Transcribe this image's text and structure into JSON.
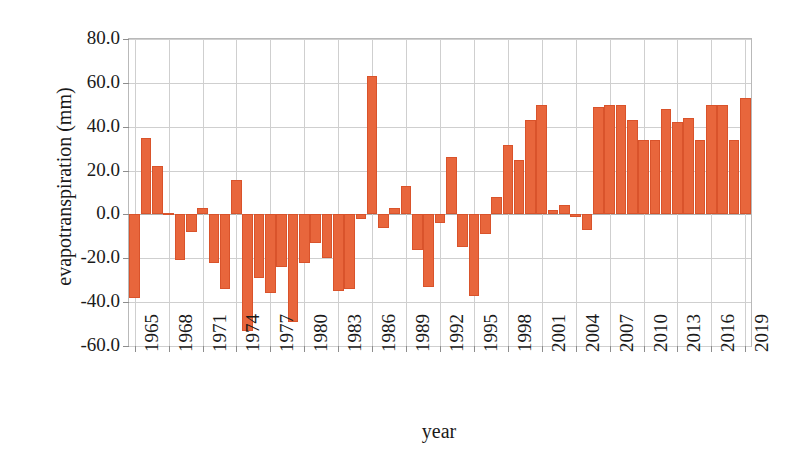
{
  "chart_data": {
    "type": "bar",
    "title": "",
    "xlabel": "year",
    "ylabel": "evapotranspiration (mm)",
    "ylim": [
      -60.0,
      80.0
    ],
    "ytick_labels": [
      "80.0",
      "60.0",
      "40.0",
      "20.0",
      "0.0",
      "-20.0",
      "-40.0",
      "-60.0"
    ],
    "ytick_values": [
      80.0,
      60.0,
      40.0,
      20.0,
      0.0,
      -20.0,
      -40.0,
      -60.0
    ],
    "xtick_labels": [
      "1965",
      "1968",
      "1971",
      "1974",
      "1977",
      "1980",
      "1983",
      "1986",
      "1989",
      "1992",
      "1995",
      "1998",
      "2001",
      "2004",
      "2007",
      "2010",
      "2013",
      "2016",
      "2019"
    ],
    "grid": true,
    "legend": "none",
    "bar_color": "#e8663c",
    "bar_edge_color": "#d9532b",
    "categories": [
      "1965",
      "1966",
      "1967",
      "1968",
      "1969",
      "1970",
      "1971",
      "1972",
      "1973",
      "1974",
      "1975",
      "1976",
      "1977",
      "1978",
      "1979",
      "1980",
      "1981",
      "1982",
      "1983",
      "1984",
      "1985",
      "1986",
      "1987",
      "1988",
      "1989",
      "1990",
      "1991",
      "1992",
      "1993",
      "1994",
      "1995",
      "1996",
      "1997",
      "1998",
      "1999",
      "2000",
      "2001",
      "2002",
      "2003",
      "2004",
      "2005",
      "2006",
      "2007",
      "2008",
      "2009",
      "2010",
      "2011",
      "2012",
      "2013",
      "2014",
      "2015",
      "2016",
      "2017",
      "2018",
      "2019"
    ],
    "values": [
      -38.0,
      35.0,
      22.0,
      0.5,
      -21.0,
      -8.0,
      3.0,
      -22.0,
      -34.0,
      15.5,
      -53.0,
      -29.0,
      -36.0,
      -24.0,
      -49.0,
      -22.0,
      -13.0,
      -20.0,
      -35.0,
      -34.0,
      -2.0,
      63.0,
      -6.0,
      3.0,
      13.0,
      -16.0,
      -33.0,
      -4.0,
      26.0,
      -15.0,
      -37.0,
      -9.0,
      8.0,
      31.5,
      25.0,
      43.0,
      50.0,
      2.0,
      4.5,
      -1.0,
      -7.0,
      49.0,
      50.0,
      50.0,
      43.0,
      34.0,
      34.0,
      48.0,
      42.0,
      44.0,
      34.0,
      50.0,
      50.0,
      34.0,
      53.0
    ]
  }
}
